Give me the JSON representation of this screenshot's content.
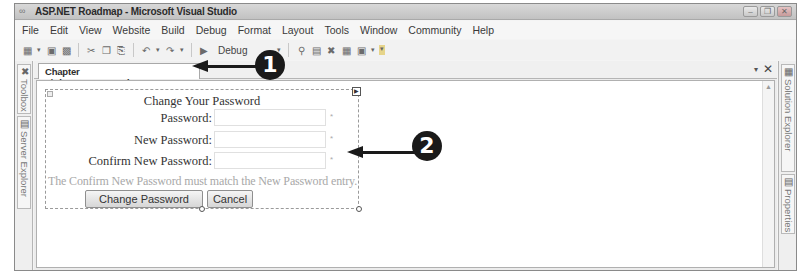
{
  "window": {
    "title": "ASP.NET Roadmap - Microsoft Visual Studio",
    "controls": {
      "minimize": "–",
      "restore": "❐",
      "close": "✕"
    }
  },
  "menubar": {
    "items": [
      "File",
      "Edit",
      "View",
      "Website",
      "Build",
      "Debug",
      "Format",
      "Layout",
      "Tools",
      "Window",
      "Community",
      "Help"
    ]
  },
  "toolbar": {
    "configuration": "Debug",
    "icons": [
      "add-item-icon",
      "save-icon",
      "save-all-icon",
      "cut-icon",
      "copy-icon",
      "paste-icon",
      "undo-icon",
      "redo-icon",
      "start-icon",
      "find-icon",
      "properties-icon",
      "toolbox-icon",
      "object-browser-icon",
      "extensions-icon"
    ]
  },
  "left_dock": {
    "tabs": [
      {
        "label": "Toolbox",
        "icon": "toolbox-icon"
      },
      {
        "label": "Server Explorer",
        "icon": "server-explorer-icon"
      }
    ]
  },
  "right_dock": {
    "tabs": [
      {
        "label": "Solution Explorer",
        "icon": "solution-explorer-icon"
      },
      {
        "label": "Properties",
        "icon": "properties-icon"
      }
    ]
  },
  "document": {
    "tab_label": "Chapter 8/ChangePassword.aspx*",
    "close_label": "✕",
    "dropdown_label": "▾"
  },
  "change_password_control": {
    "title": "Change Your Password",
    "fields": [
      {
        "label": "Password:",
        "value": "",
        "required_marker": "*"
      },
      {
        "label": "New Password:",
        "value": "",
        "required_marker": "*"
      },
      {
        "label": "Confirm New Password:",
        "value": "",
        "required_marker": "*"
      }
    ],
    "compare_message": "The Confirm New Password must match the New Password entry.",
    "buttons": {
      "change": "Change Password",
      "cancel": "Cancel"
    }
  },
  "callouts": [
    {
      "number": "1",
      "target": "document-tab"
    },
    {
      "number": "2",
      "target": "change-password-control"
    }
  ]
}
